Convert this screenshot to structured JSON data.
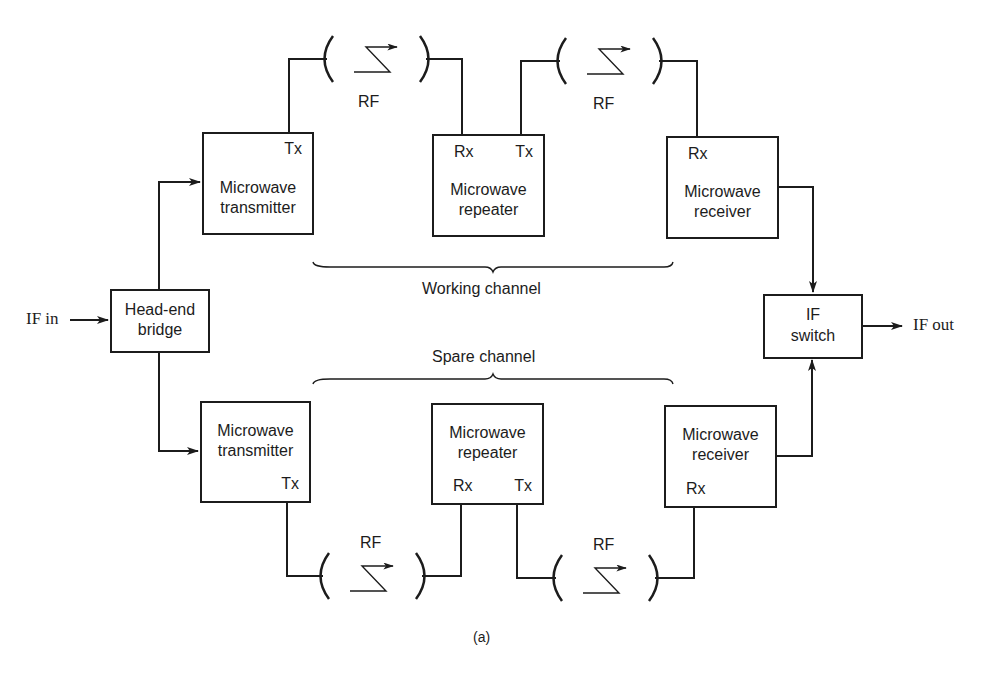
{
  "diagram": {
    "caption": "(a)",
    "inputs": {
      "if_in": "IF in"
    },
    "outputs": {
      "if_out": "IF out"
    },
    "colors": {
      "line": "#1c1c1c",
      "background": "#ffffff"
    },
    "blocks": {
      "head_end_bridge": {
        "line1": "Head-end",
        "line2": "bridge"
      },
      "if_switch": {
        "line1": "IF",
        "line2": "switch"
      }
    },
    "working_channel": {
      "label": "Working channel",
      "transmitter": {
        "line1": "Microwave",
        "line2": "transmitter",
        "port": "Tx"
      },
      "repeater": {
        "line1": "Microwave",
        "line2": "repeater",
        "port_rx": "Rx",
        "port_tx": "Tx"
      },
      "receiver": {
        "line1": "Microwave",
        "line2": "receiver",
        "port": "Rx"
      },
      "links": [
        {
          "label": "RF"
        },
        {
          "label": "RF"
        }
      ]
    },
    "spare_channel": {
      "label": "Spare channel",
      "transmitter": {
        "line1": "Microwave",
        "line2": "transmitter",
        "port": "Tx"
      },
      "repeater": {
        "line1": "Microwave",
        "line2": "repeater",
        "port_rx": "Rx",
        "port_tx": "Tx"
      },
      "receiver": {
        "line1": "Microwave",
        "line2": "receiver",
        "port": "Rx"
      },
      "links": [
        {
          "label": "RF"
        },
        {
          "label": "RF"
        }
      ]
    }
  }
}
